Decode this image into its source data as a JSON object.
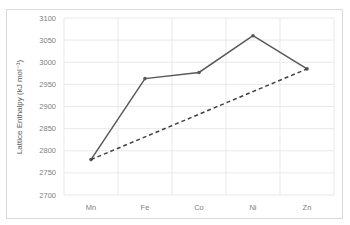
{
  "chart_data": {
    "type": "line",
    "title": "",
    "xlabel": "",
    "ylabel": "Lattice Enthalpy (kJ mol⁻¹)",
    "categories": [
      "Mn",
      "Fe",
      "Co",
      "Ni",
      "Zn"
    ],
    "ylim": [
      2700,
      3100
    ],
    "yticks": [
      2700,
      2750,
      2800,
      2850,
      2900,
      2950,
      3000,
      3050,
      3100
    ],
    "grid": true,
    "legend": "none",
    "series": [
      {
        "name": "Experimental",
        "style": "solid",
        "color": "#595959",
        "values": [
          2780,
          2963,
          2977,
          3060,
          2985
        ]
      },
      {
        "name": "Predicted trend",
        "style": "dashed",
        "color": "#404040",
        "values": [
          2780,
          null,
          null,
          null,
          2985
        ]
      }
    ]
  },
  "axis": {
    "ylabel": "Lattice Enthalpy (kJ mol⁻¹)",
    "yticks": [
      "3100",
      "3050",
      "3000",
      "2950",
      "2900",
      "2850",
      "2800",
      "2750",
      "2700"
    ],
    "xticks": [
      "Mn",
      "Fe",
      "Co",
      "Ni",
      "Zn"
    ]
  }
}
